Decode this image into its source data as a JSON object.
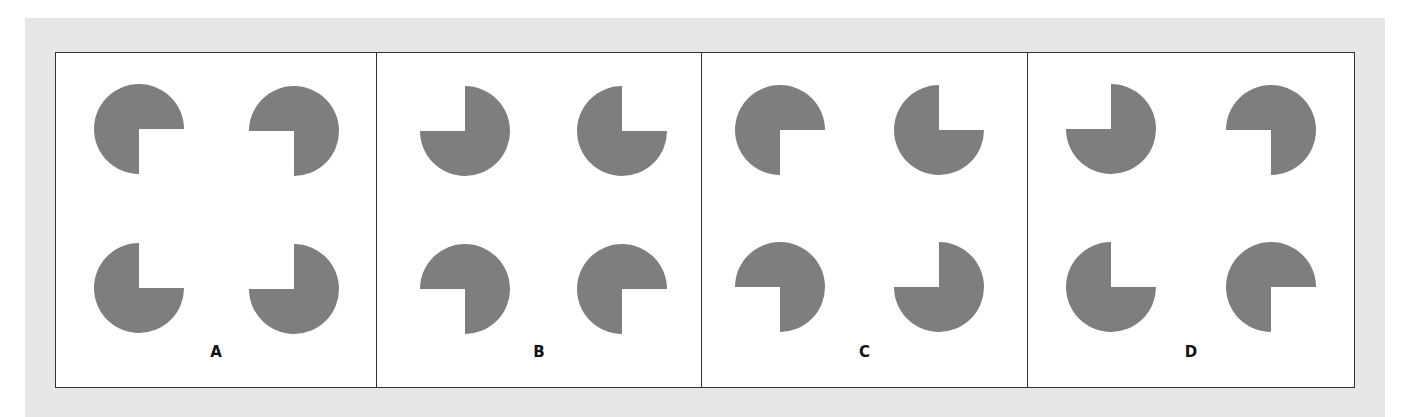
{
  "figure": {
    "background_color": "#ffffff",
    "band_color": "#e6e6e6",
    "shape_color": "#7e7e7e",
    "radius": 45,
    "panels": [
      {
        "label": "A",
        "width": 321,
        "shapes": [
          {
            "position": "top-left",
            "cx": 83,
            "cy": 76,
            "missing_quadrant": "bottom-right"
          },
          {
            "position": "top-right",
            "cx": 238,
            "cy": 78,
            "missing_quadrant": "bottom-left"
          },
          {
            "position": "bottom-left",
            "cx": 83,
            "cy": 235,
            "missing_quadrant": "top-right"
          },
          {
            "position": "bottom-right",
            "cx": 238,
            "cy": 236,
            "missing_quadrant": "top-left"
          }
        ]
      },
      {
        "label": "B",
        "width": 325,
        "shapes": [
          {
            "position": "top-left",
            "cx": 88,
            "cy": 78,
            "missing_quadrant": "top-left"
          },
          {
            "position": "top-right",
            "cx": 245,
            "cy": 78,
            "missing_quadrant": "top-right"
          },
          {
            "position": "bottom-left",
            "cx": 88,
            "cy": 236,
            "missing_quadrant": "bottom-left"
          },
          {
            "position": "bottom-right",
            "cx": 245,
            "cy": 236,
            "missing_quadrant": "bottom-right"
          }
        ]
      },
      {
        "label": "C",
        "width": 326,
        "shapes": [
          {
            "position": "top-left",
            "cx": 78,
            "cy": 77,
            "missing_quadrant": "bottom-right"
          },
          {
            "position": "top-right",
            "cx": 237,
            "cy": 77,
            "missing_quadrant": "top-right"
          },
          {
            "position": "bottom-left",
            "cx": 78,
            "cy": 234,
            "missing_quadrant": "bottom-left"
          },
          {
            "position": "bottom-right",
            "cx": 237,
            "cy": 234,
            "missing_quadrant": "top-left"
          }
        ]
      },
      {
        "label": "D",
        "width": 326,
        "shapes": [
          {
            "position": "top-left",
            "cx": 83,
            "cy": 76,
            "missing_quadrant": "top-left"
          },
          {
            "position": "top-right",
            "cx": 243,
            "cy": 77,
            "missing_quadrant": "bottom-left"
          },
          {
            "position": "bottom-left",
            "cx": 83,
            "cy": 234,
            "missing_quadrant": "top-right"
          },
          {
            "position": "bottom-right",
            "cx": 243,
            "cy": 234,
            "missing_quadrant": "bottom-right"
          }
        ]
      }
    ]
  }
}
